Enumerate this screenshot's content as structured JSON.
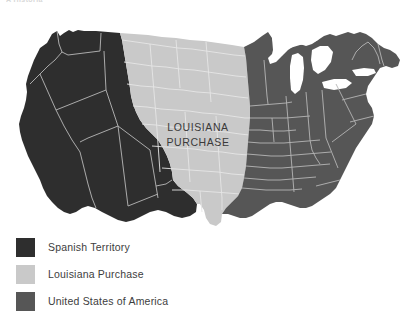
{
  "header": {
    "clipped_text": "A Historia"
  },
  "map": {
    "title_label_line1": "LOUISIANA",
    "title_label_line2": "PURCHASE",
    "background_color": "#ffffff",
    "border_color": "#b9b9b9",
    "lake_color": "#ffffff"
  },
  "legend": {
    "items": [
      {
        "label": "Spanish Territory",
        "color": "#2e2e2e"
      },
      {
        "label": "Louisiana Purchase",
        "color": "#c9c9c9"
      },
      {
        "label": "United States of America",
        "color": "#565656"
      }
    ]
  },
  "regions": {
    "spanish_territory": {
      "name": "Spanish Territory",
      "color": "#2e2e2e",
      "description": "Western North America and Texas, shown in near-black"
    },
    "louisiana_purchase": {
      "name": "Louisiana Purchase",
      "color": "#c9c9c9",
      "description": "Great Plains region from the Gulf of Mexico north to Canada, shown in light gray"
    },
    "united_states": {
      "name": "United States of America",
      "color": "#565656",
      "description": "Eastern states east of the Mississippi River, shown in medium gray"
    }
  }
}
